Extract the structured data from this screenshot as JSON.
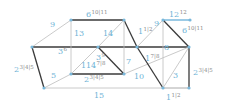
{
  "diagram": {
    "type": "graph",
    "colors": {
      "thin_edge": "#bdbdbd",
      "thick_edge": "#3a3a3a",
      "node": "#7ab8db",
      "label": "#6fb3d6",
      "superscript": "#8a8a8a",
      "highlight_edge": "#5aa9d6"
    },
    "nodes": [
      {
        "id": "n1",
        "x": 32,
        "y": 47
      },
      {
        "id": "n2",
        "x": 71,
        "y": 20
      },
      {
        "id": "n3",
        "x": 124,
        "y": 20
      },
      {
        "id": "n4",
        "x": 44,
        "y": 88
      },
      {
        "id": "n5",
        "x": 71,
        "y": 74
      },
      {
        "id": "n6",
        "x": 98,
        "y": 47
      },
      {
        "id": "n7",
        "x": 124,
        "y": 74
      },
      {
        "id": "n8",
        "x": 137,
        "y": 47
      },
      {
        "id": "n9",
        "x": 163,
        "y": 20
      },
      {
        "id": "n10",
        "x": 190,
        "y": 20
      },
      {
        "id": "n11",
        "x": 189,
        "y": 47
      },
      {
        "id": "n12",
        "x": 163,
        "y": 88
      },
      {
        "id": "n13",
        "x": 189,
        "y": 88
      }
    ],
    "edges": [
      {
        "from": "n1",
        "to": "n2",
        "style": "thin"
      },
      {
        "from": "n2",
        "to": "n3",
        "style": "thick"
      },
      {
        "from": "n1",
        "to": "n11",
        "style": "thick"
      },
      {
        "from": "n2",
        "to": "n5",
        "style": "thin"
      },
      {
        "from": "n1",
        "to": "n4",
        "style": "thick"
      },
      {
        "from": "n4",
        "to": "n5",
        "style": "thin"
      },
      {
        "from": "n4",
        "to": "n13",
        "style": "thin"
      },
      {
        "from": "n5",
        "to": "n7",
        "style": "thick"
      },
      {
        "from": "n5",
        "to": "n6",
        "style": "thin"
      },
      {
        "from": "n6",
        "to": "n3",
        "style": "thin"
      },
      {
        "from": "n6",
        "to": "n7",
        "style": "thick"
      },
      {
        "from": "n3",
        "to": "n8",
        "style": "thick"
      },
      {
        "from": "n3",
        "to": "n7",
        "style": "thin"
      },
      {
        "from": "n7",
        "to": "n11",
        "style": "thin"
      },
      {
        "from": "n8",
        "to": "n9",
        "style": "thin"
      },
      {
        "from": "n9",
        "to": "n10",
        "style": "highlight"
      },
      {
        "from": "n9",
        "to": "n11",
        "style": "thick"
      },
      {
        "from": "n8",
        "to": "n12",
        "style": "thick"
      },
      {
        "from": "n9",
        "to": "n12",
        "style": "thin"
      },
      {
        "from": "n11",
        "to": "n12",
        "style": "thin"
      },
      {
        "from": "n11",
        "to": "n13",
        "style": "thick"
      },
      {
        "from": "n12",
        "to": "n13",
        "style": "thin"
      }
    ],
    "labels": [
      {
        "x": 50,
        "y": 27,
        "text": "9",
        "sup": ""
      },
      {
        "x": 86,
        "y": 17,
        "text": "6",
        "sup": "10|11"
      },
      {
        "x": 74,
        "y": 36,
        "text": "13",
        "sup": ""
      },
      {
        "x": 103,
        "y": 36,
        "text": "14",
        "sup": ""
      },
      {
        "x": 58,
        "y": 54,
        "text": "3",
        "sup": "6"
      },
      {
        "x": 14,
        "y": 72,
        "text": "2",
        "sup": "3|4|5"
      },
      {
        "x": 51,
        "y": 78,
        "text": "5",
        "sup": ""
      },
      {
        "x": 96,
        "y": 60,
        "text": "3",
        "sup": "9"
      },
      {
        "x": 81,
        "y": 68,
        "text": "11",
        "sup": ""
      },
      {
        "x": 91,
        "y": 68,
        "text": "4",
        "sup": "7|8"
      },
      {
        "x": 84,
        "y": 82,
        "text": "2",
        "sup": "3|4|5"
      },
      {
        "x": 94,
        "y": 98,
        "text": "15",
        "sup": ""
      },
      {
        "x": 126,
        "y": 64,
        "text": "7",
        "sup": ""
      },
      {
        "x": 134,
        "y": 79,
        "text": "10",
        "sup": ""
      },
      {
        "x": 138,
        "y": 34,
        "text": "1",
        "sup": "1|2"
      },
      {
        "x": 145,
        "y": 61,
        "text": "1",
        "sup": "7|8"
      },
      {
        "x": 154,
        "y": 26,
        "text": "9",
        "sup": ""
      },
      {
        "x": 169,
        "y": 17,
        "text": "12",
        "sup": "12"
      },
      {
        "x": 182,
        "y": 33,
        "text": "6",
        "sup": "10|11"
      },
      {
        "x": 164,
        "y": 50,
        "text": "8",
        "sup": ""
      },
      {
        "x": 173,
        "y": 78,
        "text": "3",
        "sup": ""
      },
      {
        "x": 193,
        "y": 75,
        "text": "2",
        "sup": "3|4|5"
      },
      {
        "x": 166,
        "y": 100,
        "text": "1",
        "sup": "1|2"
      }
    ]
  }
}
